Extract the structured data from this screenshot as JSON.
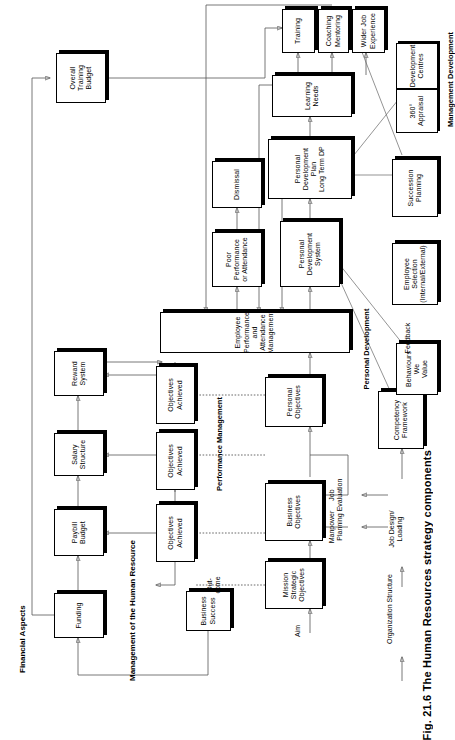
{
  "figure": {
    "caption": "Fig. 21.6  The Human Resources strategy components"
  },
  "section_titles": {
    "financial_aspects": "Financial Aspects",
    "management_of_hr": "Management of the Human Resource",
    "performance_management": "Performance Management",
    "personal_development": "Personal Development",
    "management_development": "Management Development"
  },
  "connector_labels": {
    "aim": "Aim",
    "outcome": "Out-\ncome",
    "organization_structure": "Organization Structure",
    "job_design_loading": "Job Design/\nLoading",
    "manpower_planning": "Manpower\nPlanning",
    "job_evaluation": "Job\nEvaluation",
    "feedback": "Feedback"
  },
  "boxes": {
    "funding": "Funding",
    "paybill_budget": "Paybill Budget",
    "salary_structure": "Salary Structure",
    "reward_system": "Reward System",
    "overall_training_budget": "Overall Training\nBudget",
    "business_success": "Business\nSuccess",
    "objectives_achieved_1": "Objectives Achieved",
    "objectives_achieved_2": "Objectives Achieved",
    "objectives_achieved_3": "Objectives Achieved",
    "mission_strategic_objectives": "Mission Strategic\nObjectives",
    "business_objectives": "Business Objectives",
    "personal_objectives": "Personal Objectives",
    "employee_performance": "Employee Performance and Attendance Management",
    "poor_performance": "Poor Performance\nor Attendance",
    "dismissal": "Dismissal",
    "personal_development_system": "Personal Development\nSystem",
    "personal_development_plan": "Personal Development Plan\nLong Term DP",
    "learning_needs": "Learning Needs",
    "training": "Training",
    "coaching_mentoring": "Coaching\nMentoring",
    "wider_job_experience": "Wider Job\nExperience",
    "competency_framework": "Competency Framework",
    "behaviours_we_value": "Behaviours We\nValue",
    "employee_selection": "Employee Selection\n(Internal/External)",
    "succession_planning": "Succession Planning",
    "appraisal_360": "360° Appraisal",
    "development_centres": "Development\nCentres"
  },
  "colors": {
    "ink": "#000000",
    "wire": "#555555",
    "paper": "#ffffff"
  }
}
